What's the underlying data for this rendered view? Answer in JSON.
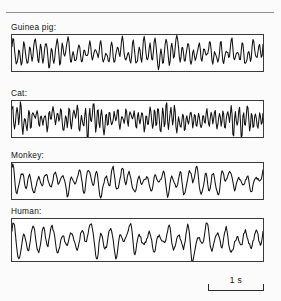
{
  "figure": {
    "background_color": "#fbfbfb",
    "trace_color": "#111111",
    "frame_color": "#3a3a3a",
    "rule_color": "#8d8d8d"
  },
  "panels": [
    {
      "label": "Guinea pig:",
      "name": "guinea-pig",
      "description": "Low-amplitude fast mixed-frequency cortical EEG trace, fairly uniform amplitude across the record"
    },
    {
      "label": "Cat:",
      "name": "cat",
      "description": "Fast, irregular EEG with alternating high-amplitude spindle bursts and low-voltage segments"
    },
    {
      "label": "Monkey:",
      "name": "monkey",
      "description": "Slower mixed-frequency EEG with intermittent larger-amplitude waves"
    },
    {
      "label": "Human:",
      "name": "human",
      "description": "Alpha-like rhythmic EEG with waxing and waning spindle-shaped bursts"
    }
  ],
  "scale_bar": {
    "label": "1 s",
    "duration_value": 1,
    "duration_unit": "s"
  },
  "chart_data": {
    "type": "line",
    "title": "",
    "xlabel": "",
    "ylabel": "",
    "grid": false,
    "legend": "none",
    "x_scale_note": "Horizontal scale bar denotes 1 s",
    "series": [
      {
        "name": "Guinea pig:",
        "samples": 300,
        "y_center": 0.5,
        "components": [
          {
            "freq": 46,
            "amp": 0.3,
            "phase": 0.0
          },
          {
            "freq": 23,
            "amp": 0.16,
            "phase": 1.1
          },
          {
            "freq": 9,
            "amp": 0.1,
            "phase": 2.4
          },
          {
            "freq": 71,
            "amp": 0.07,
            "phase": 0.7
          }
        ],
        "envelope": [
          {
            "freq": 2.1,
            "depth": 0.3,
            "phase": 0.3
          },
          {
            "freq": 4.7,
            "depth": 0.18,
            "phase": 1.9
          }
        ],
        "noise_amp": 0.05,
        "seed": 11
      },
      {
        "name": "Cat:",
        "samples": 300,
        "y_center": 0.5,
        "components": [
          {
            "freq": 62,
            "amp": 0.34,
            "phase": 0.5
          },
          {
            "freq": 31,
            "amp": 0.14,
            "phase": 2.0
          },
          {
            "freq": 13,
            "amp": 0.09,
            "phase": 0.2
          },
          {
            "freq": 88,
            "amp": 0.08,
            "phase": 1.4
          }
        ],
        "envelope": [
          {
            "freq": 3.4,
            "depth": 0.46,
            "phase": 1.2
          },
          {
            "freq": 6.8,
            "depth": 0.24,
            "phase": 0.4
          }
        ],
        "noise_amp": 0.07,
        "seed": 27
      },
      {
        "name": "Monkey:",
        "samples": 300,
        "y_center": 0.5,
        "components": [
          {
            "freq": 30,
            "amp": 0.3,
            "phase": 0.9
          },
          {
            "freq": 15,
            "amp": 0.18,
            "phase": 2.6
          },
          {
            "freq": 7,
            "amp": 0.12,
            "phase": 1.3
          },
          {
            "freq": 48,
            "amp": 0.07,
            "phase": 0.1
          }
        ],
        "envelope": [
          {
            "freq": 2.6,
            "depth": 0.42,
            "phase": 2.2
          },
          {
            "freq": 5.1,
            "depth": 0.2,
            "phase": 0.8
          }
        ],
        "noise_amp": 0.05,
        "seed": 43
      },
      {
        "name": "Human:",
        "samples": 300,
        "y_center": 0.5,
        "components": [
          {
            "freq": 26,
            "amp": 0.33,
            "phase": 0.2
          },
          {
            "freq": 13,
            "amp": 0.17,
            "phase": 1.7
          },
          {
            "freq": 6,
            "amp": 0.11,
            "phase": 2.9
          },
          {
            "freq": 40,
            "amp": 0.06,
            "phase": 1.0
          }
        ],
        "envelope": [
          {
            "freq": 2.9,
            "depth": 0.48,
            "phase": 0.6
          },
          {
            "freq": 5.6,
            "depth": 0.22,
            "phase": 2.5
          }
        ],
        "noise_amp": 0.055,
        "seed": 59
      }
    ]
  }
}
